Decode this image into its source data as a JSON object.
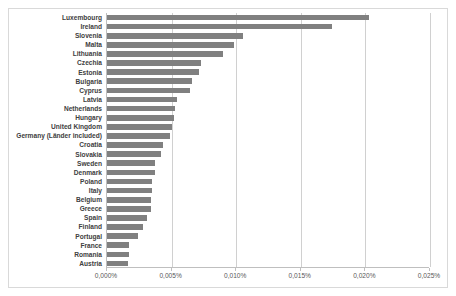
{
  "chart_data": {
    "type": "bar",
    "orientation": "horizontal",
    "title": "",
    "subtitle": "",
    "xlabel": "",
    "ylabel": "",
    "xlim": [
      0,
      0.025
    ],
    "xtick_labels": [
      "0,000%",
      "0,005%",
      "0,010%",
      "0,015%",
      "0,020%",
      "0,025%"
    ],
    "xtick_values": [
      0.0,
      0.005,
      0.01,
      0.015,
      0.02,
      0.025
    ],
    "grid": "vertical",
    "legend": "none",
    "bar_color": "#808080",
    "categories": [
      "Luxembourg",
      "Ireland",
      "Slovenia",
      "Malta",
      "Lithuania",
      "Czechia",
      "Estonia",
      "Bulgaria",
      "Cyprus",
      "Latvia",
      "Netherlands",
      "Hungary",
      "United Kingdom",
      "Germany (Länder included)",
      "Croatia",
      "Slovakia",
      "Sweden",
      "Denmark",
      "Poland",
      "Italy",
      "Belgium",
      "Greece",
      "Spain",
      "Finland",
      "Portugal",
      "France",
      "Romania",
      "Austria"
    ],
    "values": [
      0.0203,
      0.0174,
      0.0105,
      0.0098,
      0.009,
      0.0073,
      0.0071,
      0.0066,
      0.0064,
      0.0054,
      0.0053,
      0.0052,
      0.005,
      0.0049,
      0.0043,
      0.0042,
      0.0037,
      0.0037,
      0.0035,
      0.0035,
      0.0034,
      0.0034,
      0.0031,
      0.0028,
      0.0024,
      0.0017,
      0.0017,
      0.0016
    ]
  }
}
